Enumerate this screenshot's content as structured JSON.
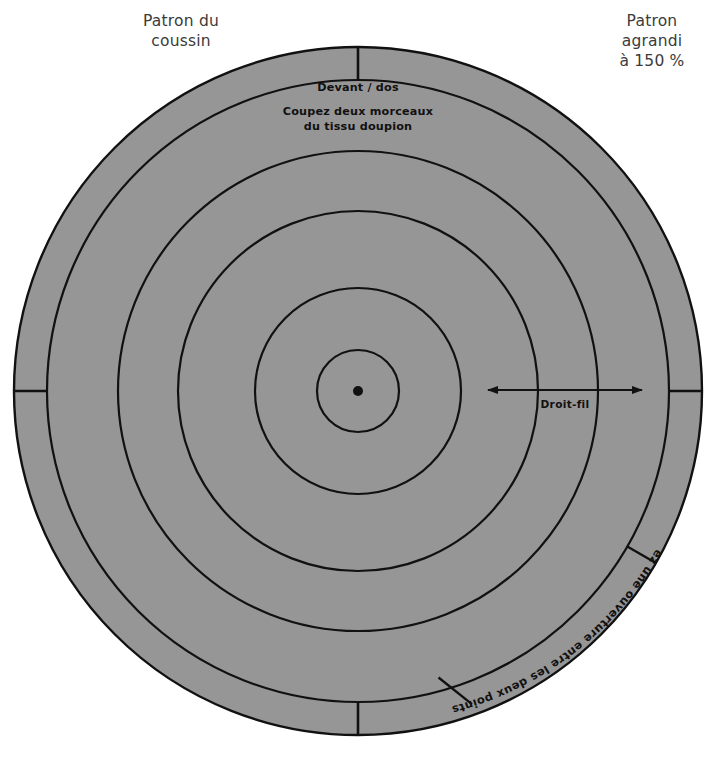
{
  "notes": {
    "top_left": "Patron du\ncoussin",
    "top_right": "Patron\nagrandi\nà 150 %"
  },
  "pattern": {
    "piece_label": "Devant / dos",
    "cut_instruction_line1": "Coupez deux morceaux",
    "cut_instruction_line2": "du tissu doupion",
    "grainline_label": "Droit-fil",
    "opening_label": "Laissez une ouverture entre les deux points"
  },
  "colors": {
    "fabric_fill": "#969696",
    "line": "#111111",
    "background": "#ffffff",
    "note_text": "#3b3b3b"
  },
  "geometry": {
    "center_x": 358,
    "center_y": 391,
    "circle_radii": [
      344,
      311,
      240,
      180,
      103,
      41
    ],
    "center_dot_radius": 5,
    "tick_angles_deg": [
      90,
      270,
      180,
      0
    ],
    "grainline_x_start": 488,
    "grainline_x_end": 642,
    "grainline_y": 390,
    "opening_start_deg": 330,
    "opening_end_deg": 255
  }
}
